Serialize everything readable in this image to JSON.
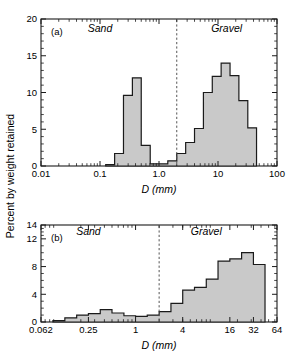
{
  "figure": {
    "ylabel": "Percent by weight retained",
    "fill_color": "#c9c9c9",
    "line_color": "#1a1a1a",
    "divider_color": "#555555"
  },
  "chart_data": [
    {
      "type": "bar",
      "panel_label": "(a)",
      "title": "",
      "xlabel": "D (mm)",
      "ylabel": "Percent by weight retained",
      "xscale": "log",
      "xlim": [
        0.01,
        100
      ],
      "ylim": [
        0,
        20
      ],
      "xticks": [
        0.01,
        0.1,
        1.0,
        10,
        100
      ],
      "xticklabels": [
        "0.01",
        "0.1",
        "1.0",
        "10",
        "100"
      ],
      "yticks": [
        0,
        5,
        10,
        15,
        20
      ],
      "yticklabels": [
        "0",
        "5",
        "10",
        "15",
        "20"
      ],
      "grid": false,
      "annotations": [
        {
          "text": "Sand",
          "x": 0.1,
          "y": 18.2
        },
        {
          "text": "Gravel",
          "x": 14.0,
          "y": 18.2
        }
      ],
      "divider": {
        "x": 2.0,
        "style": "dashed",
        "label": "sand-gravel boundary"
      },
      "bin_edges": [
        0.125,
        0.177,
        0.25,
        0.354,
        0.5,
        0.71,
        1.0,
        1.41,
        2.0,
        2.83,
        4.0,
        5.66,
        8.0,
        11.3,
        16.0,
        22.6,
        32.0,
        45.0
      ],
      "values": [
        0.2,
        1.7,
        9.6,
        12.0,
        2.8,
        0.3,
        0.3,
        0.7,
        1.7,
        3.2,
        5.1,
        10.0,
        12.2,
        14.0,
        12.3,
        8.9,
        5.2
      ]
    },
    {
      "type": "bar",
      "panel_label": "(b)",
      "title": "",
      "xlabel": "D (mm)",
      "ylabel": "Percent by weight retained",
      "xscale": "log",
      "xlim": [
        0.062,
        64
      ],
      "ylim": [
        0,
        14
      ],
      "xticks": [
        0.062,
        0.25,
        1,
        4,
        16,
        32,
        64
      ],
      "xticklabels": [
        "0.062",
        "0.25",
        "1",
        "4",
        "16",
        "32",
        "64"
      ],
      "yticks": [
        0,
        4,
        8,
        12,
        14
      ],
      "yticklabels": [
        "0",
        "4",
        "8",
        "12",
        "14"
      ],
      "grid": false,
      "annotations": [
        {
          "text": "Sand",
          "x": 0.25,
          "y": 12.6
        },
        {
          "text": "Gravel",
          "x": 8.0,
          "y": 12.6
        }
      ],
      "divider": {
        "x": 2.0,
        "style": "dashed",
        "label": "sand-gravel boundary"
      },
      "bin_edges": [
        0.088,
        0.125,
        0.177,
        0.25,
        0.354,
        0.5,
        0.71,
        1.0,
        1.41,
        2.0,
        2.83,
        4.0,
        5.66,
        8.0,
        11.3,
        16.0,
        22.6,
        32.0,
        45.0
      ],
      "values": [
        0.2,
        0.6,
        1.0,
        1.2,
        1.8,
        1.3,
        0.9,
        0.8,
        1.0,
        1.5,
        2.7,
        4.6,
        5.0,
        6.2,
        8.8,
        9.1,
        10.0,
        8.3,
        12.1,
        13.0
      ]
    }
  ]
}
